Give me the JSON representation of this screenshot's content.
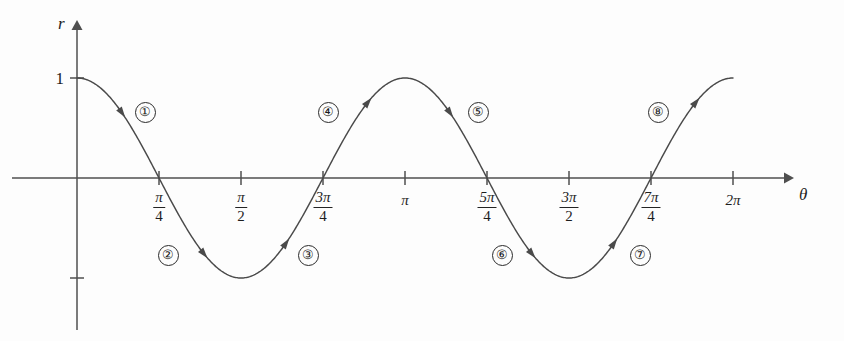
{
  "figure": {
    "background_color": "#fdfdfd",
    "curve_color": "#4a4a4a",
    "axis_color": "#4f4f4f",
    "text_color": "#1d1d1d"
  },
  "axes": {
    "y_axis_label": "r",
    "x_axis_label": "θ",
    "y_value_label": "1",
    "x_tick_labels": [
      {
        "kind": "fraction",
        "numerator": "π",
        "denominator": "4",
        "theta": 0.7853981634
      },
      {
        "kind": "fraction",
        "numerator": "π",
        "denominator": "2",
        "theta": 1.5707963268
      },
      {
        "kind": "fraction",
        "numerator": "3π",
        "denominator": "4",
        "theta": 2.3561944902
      },
      {
        "kind": "simple",
        "text": "π",
        "theta": 3.1415926536
      },
      {
        "kind": "fraction",
        "numerator": "5π",
        "denominator": "4",
        "theta": 3.926990817
      },
      {
        "kind": "fraction",
        "numerator": "3π",
        "denominator": "2",
        "theta": 4.7123889804
      },
      {
        "kind": "fraction",
        "numerator": "7π",
        "denominator": "4",
        "theta": 5.4977871438
      },
      {
        "kind": "simple",
        "text": "2π",
        "theta": 6.2831853072
      }
    ]
  },
  "segments": [
    {
      "label": "①",
      "x": 145,
      "y": 112
    },
    {
      "label": "②",
      "x": 168,
      "y": 255
    },
    {
      "label": "③",
      "x": 308,
      "y": 255
    },
    {
      "label": "④",
      "x": 328,
      "y": 112
    },
    {
      "label": "⑤",
      "x": 478,
      "y": 112
    },
    {
      "label": "⑥",
      "x": 502,
      "y": 255
    },
    {
      "label": "⑦",
      "x": 640,
      "y": 255
    },
    {
      "label": "⑧",
      "x": 658,
      "y": 112
    }
  ],
  "chart_data": {
    "type": "line",
    "title": "",
    "xlabel": "θ",
    "ylabel": "r",
    "function": "r = cos(2θ)",
    "xlim": [
      0,
      6.2831853072
    ],
    "ylim": [
      -1,
      1
    ],
    "grid": false,
    "legend": "none",
    "x_tick_values": [
      0.7853981634,
      1.5707963268,
      2.3561944902,
      3.1415926536,
      3.926990817,
      4.7123889804,
      5.4977871438,
      6.2831853072
    ],
    "x_tick_text": [
      "π/4",
      "π/2",
      "3π/4",
      "π",
      "5π/4",
      "3π/2",
      "7π/4",
      "2π"
    ],
    "y_tick_values": [
      1,
      -1
    ],
    "y_tick_text": [
      "1",
      ""
    ],
    "series": [
      {
        "name": "r = cos(2θ)",
        "x": [
          0.0,
          0.19634954,
          0.39269908,
          0.58904862,
          0.78539816,
          0.9817477,
          1.17809725,
          1.37444679,
          1.57079633,
          1.76714587,
          1.96349541,
          2.15984495,
          2.35619449,
          2.55254403,
          2.74889357,
          2.94524311,
          3.14159265,
          3.3379422,
          3.53429174,
          3.73064128,
          3.92699082,
          4.12334036,
          4.3196899,
          4.51603944,
          4.71238898,
          4.90873852,
          5.10508806,
          5.3014376,
          5.49778714,
          5.69413668,
          5.89048623,
          6.08683577,
          6.28318531
        ],
        "y": [
          1.0,
          0.92388,
          0.70711,
          0.38268,
          0.0,
          -0.38268,
          -0.70711,
          -0.92388,
          -1.0,
          -0.92388,
          -0.70711,
          -0.38268,
          0.0,
          0.38268,
          0.70711,
          0.92388,
          1.0,
          0.92388,
          0.70711,
          0.38268,
          0.0,
          -0.38268,
          -0.70711,
          -0.92388,
          -1.0,
          -0.92388,
          -0.70711,
          -0.38268,
          0.0,
          0.38268,
          0.70711,
          0.92388,
          1.0
        ]
      }
    ],
    "annotations": [
      {
        "text": "①",
        "theta_range": [
          0.0,
          0.7853981634
        ],
        "description": "descending branch from r=1 to r=0"
      },
      {
        "text": "②",
        "theta_range": [
          0.7853981634,
          1.5707963268
        ],
        "description": "descending branch from r=0 to r=-1"
      },
      {
        "text": "③",
        "theta_range": [
          1.5707963268,
          2.3561944902
        ],
        "description": "ascending branch from r=-1 to r=0"
      },
      {
        "text": "④",
        "theta_range": [
          2.3561944902,
          3.1415926536
        ],
        "description": "ascending branch from r=0 to r=1"
      },
      {
        "text": "⑤",
        "theta_range": [
          3.1415926536,
          3.926990817
        ],
        "description": "descending branch from r=1 to r=0"
      },
      {
        "text": "⑥",
        "theta_range": [
          3.926990817,
          4.7123889804
        ],
        "description": "descending branch from r=0 to r=-1"
      },
      {
        "text": "⑦",
        "theta_range": [
          4.7123889804,
          5.4977871438
        ],
        "description": "ascending branch from r=-1 to r=0"
      },
      {
        "text": "⑧",
        "theta_range": [
          5.4977871438,
          6.2831853072
        ],
        "description": "ascending branch from r=0 to r=1"
      }
    ]
  }
}
